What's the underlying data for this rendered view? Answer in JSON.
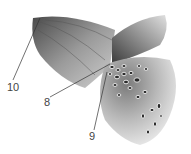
{
  "figure": {
    "colors": {
      "dark": "#3a3a3a",
      "mid": "#8a8a8a",
      "light": "#d8d8d8",
      "line": "#333333"
    }
  },
  "labels": [
    {
      "text": "10",
      "x": 7,
      "y": 82,
      "tx": 40,
      "ty": 18
    },
    {
      "text": "8",
      "x": 44,
      "y": 98,
      "tx": 110,
      "ty": 64
    },
    {
      "text": "9",
      "x": 90,
      "y": 132,
      "tx": 107,
      "ty": 72
    }
  ]
}
